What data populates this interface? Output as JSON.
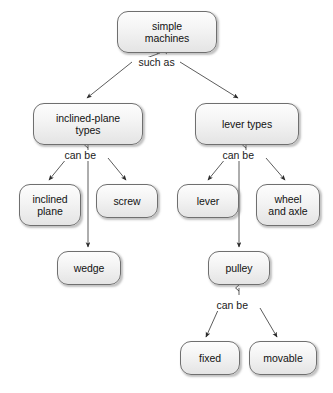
{
  "diagram": {
    "type": "concept-map",
    "background_color": "#ffffff",
    "node_border_color": "#6f6f6f",
    "node_fill_top_color": "#fdfdfd",
    "node_fill_bottom_color": "#e4e4e4",
    "edge_color": "#4a4a4a",
    "text_color": "#121212",
    "nodes": [
      {
        "id": "simple-machines",
        "label": "simple\nmachines",
        "x": 117,
        "y": 11,
        "w": 100,
        "h": 42
      },
      {
        "id": "inclined-plane-types",
        "label": "inclined-plane\ntypes",
        "x": 33,
        "y": 103,
        "w": 110,
        "h": 42
      },
      {
        "id": "lever-types",
        "label": "lever types",
        "x": 195,
        "y": 103,
        "w": 104,
        "h": 42
      },
      {
        "id": "inclined-plane",
        "label": "inclined\nplane",
        "x": 19,
        "y": 184,
        "w": 62,
        "h": 42
      },
      {
        "id": "screw",
        "label": "screw",
        "x": 96,
        "y": 184,
        "w": 62,
        "h": 34
      },
      {
        "id": "lever",
        "label": "lever",
        "x": 177,
        "y": 184,
        "w": 62,
        "h": 34
      },
      {
        "id": "wheel-and-axle",
        "label": "wheel\nand axle",
        "x": 256,
        "y": 184,
        "w": 64,
        "h": 42
      },
      {
        "id": "wedge",
        "label": "wedge",
        "x": 57,
        "y": 251,
        "w": 64,
        "h": 34
      },
      {
        "id": "pulley",
        "label": "pulley",
        "x": 208,
        "y": 251,
        "w": 62,
        "h": 34
      },
      {
        "id": "fixed",
        "label": "fixed",
        "x": 180,
        "y": 341,
        "w": 60,
        "h": 34
      },
      {
        "id": "movable",
        "label": "movable",
        "x": 249,
        "y": 341,
        "w": 68,
        "h": 34
      }
    ],
    "edges": [
      {
        "id": "edge-root-to-inclined-plane-types",
        "from": "simple-machines",
        "to": "inclined-plane-types",
        "label": "such as"
      },
      {
        "id": "edge-root-to-lever-types",
        "from": "simple-machines",
        "to": "lever-types",
        "label": "such as"
      },
      {
        "id": "edge-ipt-to-inclined-plane",
        "from": "inclined-plane-types",
        "to": "inclined-plane",
        "label": "can be"
      },
      {
        "id": "edge-ipt-to-wedge",
        "from": "inclined-plane-types",
        "to": "wedge",
        "label": "can be"
      },
      {
        "id": "edge-ipt-to-screw",
        "from": "inclined-plane-types",
        "to": "screw",
        "label": "can be"
      },
      {
        "id": "edge-lt-to-lever",
        "from": "lever-types",
        "to": "lever",
        "label": "can be"
      },
      {
        "id": "edge-lt-to-pulley",
        "from": "lever-types",
        "to": "pulley",
        "label": "can be"
      },
      {
        "id": "edge-lt-to-wheel-and-axle",
        "from": "lever-types",
        "to": "wheel-and-axle",
        "label": "can be"
      },
      {
        "id": "edge-pulley-to-fixed",
        "from": "pulley",
        "to": "fixed",
        "label": "can be"
      },
      {
        "id": "edge-pulley-to-movable",
        "from": "pulley",
        "to": "movable",
        "label": "can be"
      }
    ],
    "edge_labels": [
      {
        "id": "such-as-root",
        "text": "such as",
        "x": 137,
        "y": 57
      },
      {
        "id": "can-be-left",
        "text": "can be",
        "x": 63,
        "y": 150
      },
      {
        "id": "can-be-right",
        "text": "can be",
        "x": 221,
        "y": 150
      },
      {
        "id": "can-be-pulley",
        "text": "can be",
        "x": 215,
        "y": 300
      }
    ]
  }
}
